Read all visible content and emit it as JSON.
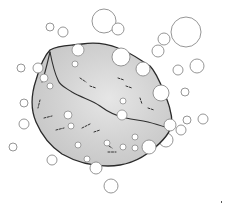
{
  "image": {
    "subject": "sketch of a porous rock or sponge surrounded by bubbles",
    "width": 226,
    "height": 209,
    "background": "#ffffff",
    "rock_fill": "#d4d4d4",
    "outline_color": "#2a2a2a",
    "bubble_stroke": "#8a8a8a"
  },
  "bubbles_outside": [
    {
      "cx": 104,
      "cy": 21,
      "r": 12
    },
    {
      "cx": 118,
      "cy": 29,
      "r": 6
    },
    {
      "cx": 186,
      "cy": 32,
      "r": 15
    },
    {
      "cx": 164,
      "cy": 39,
      "r": 6
    },
    {
      "cx": 158,
      "cy": 51,
      "r": 6
    },
    {
      "cx": 50,
      "cy": 27,
      "r": 4
    },
    {
      "cx": 63,
      "cy": 32,
      "r": 5
    },
    {
      "cx": 197,
      "cy": 66,
      "r": 7
    },
    {
      "cx": 178,
      "cy": 70,
      "r": 5
    },
    {
      "cx": 21,
      "cy": 68,
      "r": 4
    },
    {
      "cx": 24,
      "cy": 103,
      "r": 4
    },
    {
      "cx": 24,
      "cy": 124,
      "r": 5
    },
    {
      "cx": 13,
      "cy": 147,
      "r": 4
    },
    {
      "cx": 52,
      "cy": 160,
      "r": 5
    },
    {
      "cx": 185,
      "cy": 92,
      "r": 4
    },
    {
      "cx": 203,
      "cy": 119,
      "r": 5
    },
    {
      "cx": 187,
      "cy": 120,
      "r": 4
    },
    {
      "cx": 181,
      "cy": 130,
      "r": 5
    },
    {
      "cx": 166,
      "cy": 140,
      "r": 7
    },
    {
      "cx": 111,
      "cy": 186,
      "r": 7
    }
  ],
  "bubbles_edge": [
    {
      "cx": 121,
      "cy": 57,
      "r": 9
    },
    {
      "cx": 143,
      "cy": 69,
      "r": 7
    },
    {
      "cx": 161,
      "cy": 93,
      "r": 8
    },
    {
      "cx": 170,
      "cy": 125,
      "r": 6
    },
    {
      "cx": 149,
      "cy": 147,
      "r": 7
    },
    {
      "cx": 96,
      "cy": 168,
      "r": 6
    },
    {
      "cx": 38,
      "cy": 68,
      "r": 5
    }
  ],
  "bubbles_inside": [
    {
      "cx": 78,
      "cy": 50,
      "r": 6
    },
    {
      "cx": 75,
      "cy": 64,
      "r": 3
    },
    {
      "cx": 44,
      "cy": 78,
      "r": 4
    },
    {
      "cx": 50,
      "cy": 86,
      "r": 3
    },
    {
      "cx": 123,
      "cy": 101,
      "r": 3
    },
    {
      "cx": 122,
      "cy": 115,
      "r": 5
    },
    {
      "cx": 68,
      "cy": 115,
      "r": 4
    },
    {
      "cx": 71,
      "cy": 126,
      "r": 3
    },
    {
      "cx": 135,
      "cy": 137,
      "r": 3
    },
    {
      "cx": 123,
      "cy": 147,
      "r": 3
    },
    {
      "cx": 135,
      "cy": 148,
      "r": 3
    },
    {
      "cx": 87,
      "cy": 159,
      "r": 3
    },
    {
      "cx": 107,
      "cy": 143,
      "r": 3
    },
    {
      "cx": 78,
      "cy": 145,
      "r": 3
    }
  ],
  "marks": [
    {
      "x": 221,
      "y": 201
    }
  ]
}
